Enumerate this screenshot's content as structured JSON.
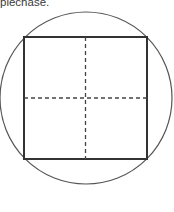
{
  "caption": {
    "text": "plechase."
  },
  "diagram": {
    "circle": {
      "cx": 86,
      "cy": 98,
      "r": 86,
      "stroke": "#555555",
      "stroke_width": 1.2
    },
    "square": {
      "x": 24,
      "y": 37,
      "width": 123,
      "height": 122,
      "stroke": "#333333",
      "stroke_width": 2
    },
    "dashed_vertical": {
      "x": 85.5,
      "y1": 37,
      "y2": 159,
      "dash": "4 3",
      "stroke": "#444444"
    },
    "dashed_horizontal": {
      "y": 98,
      "x1": 24,
      "x2": 147,
      "dash": "4 3",
      "stroke": "#444444"
    }
  },
  "colors": {
    "background": "#ffffff",
    "line": "#333333",
    "text": "#3a3a3a"
  }
}
